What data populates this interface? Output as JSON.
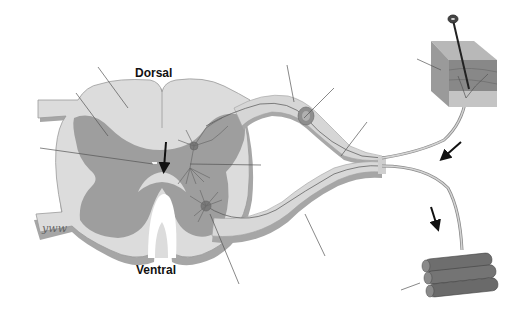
{
  "diagram": {
    "labels": {
      "dorsal": "Dorsal",
      "ventral": "Ventral"
    },
    "signature": "yww",
    "colors": {
      "background": "#ffffff",
      "white_matter": "#d9d9d9",
      "white_matter_edge": "#9a9a9a",
      "gray_matter": "#9b9b9b",
      "nerve": "#d4d4d4",
      "nerve_shadow": "#a8a8a8",
      "neuron": "#6e6e6e",
      "leader_line": "#555555",
      "arrow": "#111111",
      "skin": "#8a8a8a",
      "muscle": "#6a6a6a"
    },
    "leader_lines": [
      {
        "id": "dorsal-white-matter",
        "x1": 98,
        "y1": 67,
        "x2": 128,
        "y2": 108
      },
      {
        "id": "dorsal-horn",
        "x1": 76,
        "y1": 93,
        "x2": 108,
        "y2": 136
      },
      {
        "id": "central-canal",
        "x1": 40,
        "y1": 148,
        "x2": 153,
        "y2": 164
      },
      {
        "id": "interneuron",
        "x1": 190,
        "y1": 164,
        "x2": 261,
        "y2": 165
      },
      {
        "id": "motor-neuron",
        "x1": 210,
        "y1": 214,
        "x2": 239,
        "y2": 284
      },
      {
        "id": "dorsal-root",
        "x1": 287,
        "y1": 65,
        "x2": 294,
        "y2": 102
      },
      {
        "id": "dorsal-root-ganglion",
        "x1": 334,
        "y1": 88,
        "x2": 304,
        "y2": 118
      },
      {
        "id": "spinal-nerve",
        "x1": 367,
        "y1": 122,
        "x2": 341,
        "y2": 156
      },
      {
        "id": "ventral-root",
        "x1": 305,
        "y1": 214,
        "x2": 325,
        "y2": 256
      },
      {
        "id": "sensory-receptor",
        "x1": 417,
        "y1": 59,
        "x2": 441,
        "y2": 70
      },
      {
        "id": "effector-muscle",
        "x1": 401,
        "y1": 290,
        "x2": 420,
        "y2": 283
      }
    ],
    "arrows": [
      {
        "id": "interneuron-direction",
        "x1": 166,
        "y1": 142,
        "x2": 164,
        "y2": 172
      },
      {
        "id": "sensory-direction",
        "x1": 461,
        "y1": 142,
        "x2": 441,
        "y2": 160
      },
      {
        "id": "motor-direction",
        "x1": 431,
        "y1": 207,
        "x2": 439,
        "y2": 230
      }
    ]
  }
}
